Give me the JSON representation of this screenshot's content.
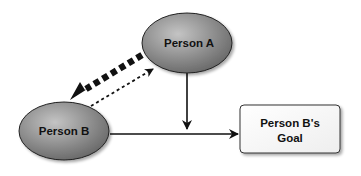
{
  "diagram": {
    "nodes": [
      {
        "id": "person-a",
        "label": "Person A",
        "shape": "ellipse"
      },
      {
        "id": "person-b",
        "label": "Person B",
        "shape": "ellipse"
      },
      {
        "id": "goal",
        "label_line1": "Person B's",
        "label_line2": "Goal",
        "shape": "rounded-rect"
      }
    ],
    "edges": [
      {
        "from": "person-a",
        "to": "person-b",
        "style": "thick-dashed"
      },
      {
        "from": "person-b",
        "to": "person-a",
        "style": "dotted"
      },
      {
        "from": "person-a",
        "to": "edge:person-b->goal",
        "style": "solid"
      },
      {
        "from": "person-b",
        "to": "goal",
        "style": "solid"
      }
    ]
  },
  "colors": {
    "ellipse_fill_light": "#b8b8b8",
    "ellipse_fill_dark": "#6a6a6a",
    "box_fill": "#ffffff",
    "stroke": "#111111"
  }
}
